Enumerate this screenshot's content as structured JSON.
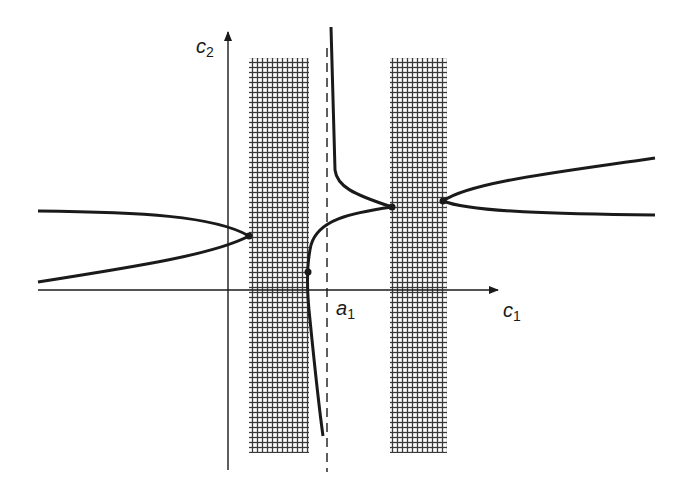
{
  "diagram": {
    "type": "phase-plane sketch",
    "colors": {
      "ink": "#1a1a1a",
      "hatch": "#333333",
      "background": "#ffffff"
    },
    "axes": {
      "x_label": {
        "base": "c",
        "sub": "1"
      },
      "y_label": {
        "base": "c",
        "sub": "2"
      },
      "origin_px": [
        228,
        290
      ],
      "x_range_px": [
        38,
        498
      ],
      "y_range_px": [
        32,
        470
      ]
    },
    "asymptote": {
      "label": {
        "base": "a",
        "sub": "1"
      },
      "x_px": 327,
      "style": "dashed"
    },
    "shaded_bands": [
      {
        "name": "band-left",
        "x_px": [
          249,
          309
        ],
        "y_px": [
          58,
          453
        ]
      },
      {
        "name": "band-right",
        "x_px": [
          390,
          447
        ],
        "y_px": [
          58,
          453
        ]
      }
    ],
    "marked_points": [
      {
        "name": "left-branch-vertex",
        "x_px": 249,
        "y_px": 236
      },
      {
        "name": "middle-curve-point",
        "x_px": 308,
        "y_px": 272
      },
      {
        "name": "middle-curve-peak",
        "x_px": 392,
        "y_px": 207
      },
      {
        "name": "right-branch-vertex",
        "x_px": 443,
        "y_px": 201
      }
    ]
  }
}
